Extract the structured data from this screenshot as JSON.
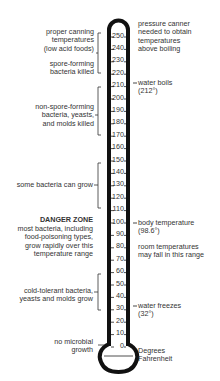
{
  "diagram": {
    "unit_label": [
      "Degrees",
      "Fahrenheit"
    ],
    "scale": {
      "min": 0,
      "max": 250,
      "step": 10,
      "ticks": [
        "250",
        "240",
        "230",
        "220",
        "210",
        "200",
        "190",
        "180",
        "170",
        "160",
        "150",
        "140",
        "130",
        "120",
        "110",
        "100",
        "90",
        "80",
        "70",
        "60",
        "50",
        "40",
        "30",
        "20",
        "10",
        "0"
      ]
    },
    "left_annotations": [
      {
        "id": "canning",
        "lines": [
          "proper canning",
          "temperatures",
          "(low acid foods)"
        ]
      },
      {
        "id": "spore",
        "lines": [
          "spore-forming",
          "bacteria killed"
        ]
      },
      {
        "id": "nonspore",
        "lines": [
          "non-spore-forming",
          "bacteria, yeasts,",
          "and molds killed"
        ]
      },
      {
        "id": "somebact",
        "lines": [
          "some bacteria can grow"
        ]
      },
      {
        "id": "danger_title",
        "lines": [
          "DANGER ZONE"
        ]
      },
      {
        "id": "danger",
        "lines": [
          "most bacteria, including",
          "food-poisoning types,",
          "grow rapidly over this",
          "temperature range"
        ]
      },
      {
        "id": "cold",
        "lines": [
          "cold-tolerant bacteria,",
          "yeasts and molds grow"
        ]
      },
      {
        "id": "nogrowth",
        "lines": [
          "no microbial",
          "growth"
        ]
      }
    ],
    "right_annotations": [
      {
        "id": "pressure",
        "lines": [
          "pressure canner",
          "needed to obtain",
          "temperatures",
          "above boiling"
        ]
      },
      {
        "id": "boils",
        "lines": [
          "water boils",
          "(212°)"
        ]
      },
      {
        "id": "body",
        "lines": [
          "body temperature",
          "(98.6°)"
        ]
      },
      {
        "id": "room",
        "lines": [
          "room temperatures",
          "may fall in this range"
        ]
      },
      {
        "id": "freezes",
        "lines": [
          "water freezes",
          "(32°)"
        ]
      },
      {
        "id": "unit",
        "lines": [
          "Degrees",
          "Fahrenheit"
        ]
      }
    ],
    "colors": {
      "outline": "#111111",
      "text": "#333333",
      "background": "#ffffff"
    }
  }
}
